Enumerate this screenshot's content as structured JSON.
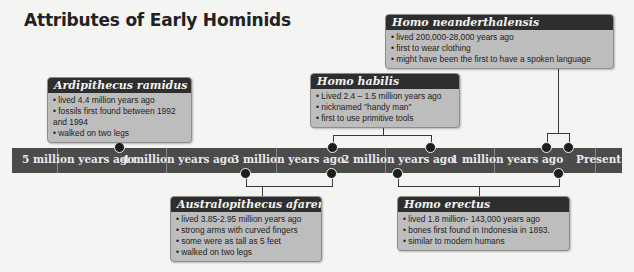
{
  "title": "Attributes of Early Hominids",
  "timeline": {
    "labels": [
      "5 million years ago",
      "4 million years ago",
      "3 million years ago",
      "2 million years ago",
      "1 million years ago",
      "Present"
    ]
  },
  "species": [
    {
      "name": "Ardipithecus ramidus",
      "facts": [
        "lived 4.4 million years ago",
        "fossils first found between 1992 and 1994",
        "walked on two legs"
      ]
    },
    {
      "name": "Homo neanderthalensis",
      "facts": [
        "lived 200,000-28,000 years ago",
        "first to wear clothing",
        "might have been the first to have a spoken language"
      ]
    },
    {
      "name": "Homo habilis",
      "facts": [
        "Lived 2.4 – 1.5 million years ago",
        "nicknamed \"handy man\"",
        "first to use primitive tools"
      ]
    },
    {
      "name": "Australopithecus afarenis",
      "facts": [
        "lived 3.85-2.95 million years ago",
        "strong arms with curved fingers",
        "some were as tall as 5 feet",
        "walked on two legs"
      ]
    },
    {
      "name": "Homo erectus",
      "facts": [
        "lived 1.8 million- 143,000 years ago",
        "bones first found in Indonesia in 1893.",
        "similar to modern humans"
      ]
    }
  ],
  "colors": {
    "bar": "#4b4b4b",
    "card_header": "#2e2e2e",
    "card_body": "#bdbdbd",
    "background": "#f4f4f2"
  }
}
